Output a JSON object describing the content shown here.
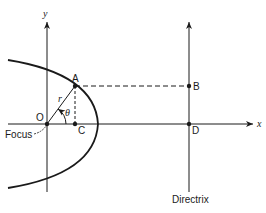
{
  "diagram": {
    "type": "parabola-focus-directrix",
    "axes": {
      "x_label": "x",
      "y_label": "y"
    },
    "points": {
      "origin": "O",
      "A": "A",
      "B": "B",
      "C": "C",
      "D": "D"
    },
    "labels": {
      "radius": "r",
      "angle": "θ",
      "focus": "Focus",
      "directrix": "Directrix"
    },
    "colors": {
      "stroke": "#1a1a1a",
      "background": "#ffffff"
    }
  }
}
